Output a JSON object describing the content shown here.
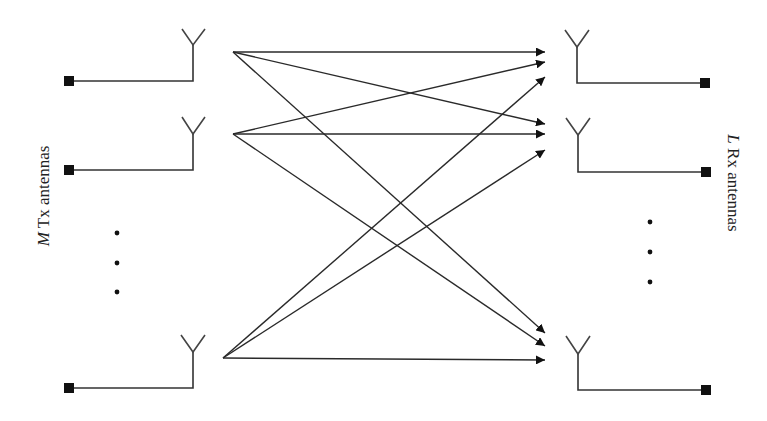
{
  "diagram": {
    "type": "MIMO channel diagram",
    "tx_label": {
      "variable": "M",
      "text": " Tx antennas"
    },
    "rx_label": {
      "variable": "L",
      "text": " Rx antennas"
    },
    "colors": {
      "line": "#333333",
      "terminal": "#111111",
      "background": "#ffffff"
    },
    "tx_antennas": [
      {
        "id": "tx-1",
        "terminal": [
          69,
          81
        ],
        "feed_y": 81,
        "mast_x": 193,
        "tip": [
          193,
          45
        ],
        "arms": [
          [
            182,
            29
          ],
          [
            205,
            29
          ]
        ],
        "origin": [
          233,
          52
        ]
      },
      {
        "id": "tx-2",
        "terminal": [
          69,
          170
        ],
        "feed_y": 170,
        "mast_x": 193,
        "tip": [
          193,
          134
        ],
        "arms": [
          [
            182,
            117
          ],
          [
            205,
            117
          ]
        ],
        "origin": [
          233,
          134
        ]
      },
      {
        "id": "tx-M",
        "terminal": [
          69,
          388
        ],
        "feed_y": 388,
        "mast_x": 193,
        "tip": [
          193,
          352
        ],
        "arms": [
          [
            181,
            335
          ],
          [
            205,
            335
          ]
        ],
        "origin": [
          223,
          358
        ]
      }
    ],
    "rx_antennas": [
      {
        "id": "rx-1",
        "terminal": [
          705,
          83
        ],
        "feed_y": 83,
        "mast_x": 577,
        "tip": [
          577,
          47
        ],
        "arms": [
          [
            565,
            30
          ],
          [
            589,
            30
          ]
        ]
      },
      {
        "id": "rx-2",
        "terminal": [
          706,
          172
        ],
        "feed_y": 172,
        "mast_x": 578,
        "tip": [
          578,
          135
        ],
        "arms": [
          [
            566,
            118
          ],
          [
            590,
            118
          ]
        ]
      },
      {
        "id": "rx-L",
        "terminal": [
          706,
          390
        ],
        "feed_y": 390,
        "mast_x": 578,
        "tip": [
          578,
          354
        ],
        "arms": [
          [
            566,
            336
          ],
          [
            590,
            336
          ]
        ]
      }
    ],
    "links": [
      {
        "from": "tx-1",
        "to": "rx-1",
        "start": [
          233,
          52
        ],
        "end": [
          545,
          52
        ]
      },
      {
        "from": "tx-1",
        "to": "rx-2",
        "start": [
          233,
          52
        ],
        "end": [
          545,
          124
        ]
      },
      {
        "from": "tx-1",
        "to": "rx-L",
        "start": [
          233,
          52
        ],
        "end": [
          545,
          333
        ]
      },
      {
        "from": "tx-2",
        "to": "rx-1",
        "start": [
          233,
          134
        ],
        "end": [
          545,
          62
        ]
      },
      {
        "from": "tx-2",
        "to": "rx-2",
        "start": [
          233,
          134
        ],
        "end": [
          545,
          134
        ]
      },
      {
        "from": "tx-2",
        "to": "rx-L",
        "start": [
          233,
          134
        ],
        "end": [
          545,
          346
        ]
      },
      {
        "from": "tx-M",
        "to": "rx-1",
        "start": [
          223,
          358
        ],
        "end": [
          545,
          77
        ]
      },
      {
        "from": "tx-M",
        "to": "rx-2",
        "start": [
          223,
          358
        ],
        "end": [
          545,
          150
        ]
      },
      {
        "from": "tx-M",
        "to": "rx-L",
        "start": [
          223,
          358
        ],
        "end": [
          545,
          360
        ]
      }
    ],
    "ellipsis": {
      "tx": [
        [
          117,
          233
        ],
        [
          117,
          263
        ],
        [
          117,
          292
        ]
      ],
      "rx": [
        [
          650,
          222
        ],
        [
          650,
          252
        ],
        [
          650,
          282
        ]
      ]
    }
  }
}
